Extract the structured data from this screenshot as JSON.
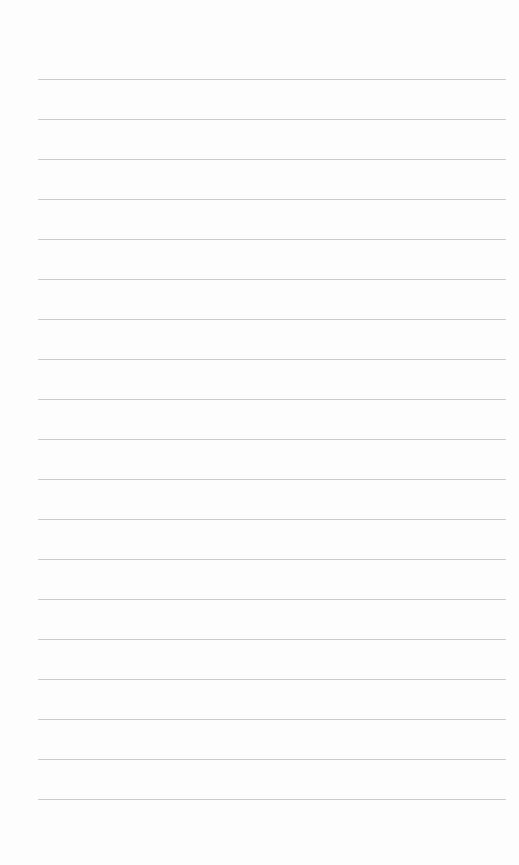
{
  "page": {
    "type": "lined-paper",
    "background_color": "#fdfdfd",
    "line_color": "#c6c6c6",
    "line_count": 19,
    "first_line_y": 79,
    "line_spacing": 40,
    "line_left": 38,
    "line_right": 506
  }
}
